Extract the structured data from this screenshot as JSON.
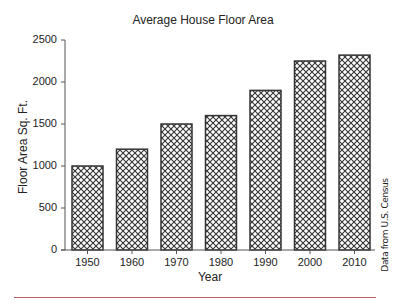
{
  "chart_data": {
    "type": "bar",
    "title": "Average House Floor Area",
    "xlabel": "Year",
    "ylabel": "Floor Area Sq. Ft.",
    "categories": [
      "1950",
      "1960",
      "1970",
      "1980",
      "1990",
      "2000",
      "2010"
    ],
    "values": [
      1000,
      1200,
      1500,
      1600,
      1900,
      2250,
      2320
    ],
    "ylim": [
      0,
      2500
    ],
    "yticks": [
      "0",
      "500",
      "1000",
      "1500",
      "2000",
      "2500"
    ],
    "grid": false,
    "legend": null,
    "bar_fill": "crosshatch",
    "annotation": "Data from U.S. Census"
  },
  "colors": {
    "bar_stroke": "#333333",
    "hatch": "#333333",
    "axis": "#555555",
    "rule": "#c05a64"
  }
}
